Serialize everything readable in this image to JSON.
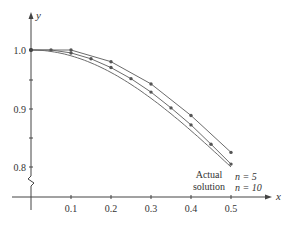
{
  "chart_data": {
    "type": "line",
    "title": "",
    "xlabel": "x",
    "ylabel": "y",
    "xlim": [
      0,
      0.55
    ],
    "ylim": [
      0.75,
      1.05
    ],
    "x_ticks": [
      "0.1",
      "0.2",
      "0.3",
      "0.4",
      "0.5"
    ],
    "y_ticks": [
      "0.8",
      "0.9",
      "1.0"
    ],
    "axis_break": "y-axis break between 0.8 and x-axis",
    "grid": false,
    "series": [
      {
        "name": "n = 5",
        "x": [
          0,
          0.1,
          0.2,
          0.3,
          0.4,
          0.5
        ],
        "y": [
          1.0,
          1.0,
          0.98,
          0.942,
          0.888,
          0.825
        ],
        "markers": true
      },
      {
        "name": "n = 10",
        "x": [
          0,
          0.05,
          0.1,
          0.15,
          0.2,
          0.25,
          0.3,
          0.35,
          0.4,
          0.45,
          0.5
        ],
        "y": [
          1.0,
          1.0,
          0.995,
          0.985,
          0.97,
          0.951,
          0.928,
          0.901,
          0.872,
          0.839,
          0.805
        ],
        "markers": true
      },
      {
        "name": "Actual solution",
        "x": [
          0,
          0.05,
          0.1,
          0.15,
          0.2,
          0.25,
          0.3,
          0.35,
          0.4,
          0.45,
          0.5
        ],
        "y": [
          1.0,
          0.9975,
          0.99,
          0.978,
          0.962,
          0.941,
          0.917,
          0.891,
          0.862,
          0.832,
          0.8
        ],
        "markers": false
      }
    ],
    "annotations": [
      {
        "text": "n = 5",
        "at": [
          0.5,
          0.825
        ]
      },
      {
        "text": "n = 10",
        "at": [
          0.5,
          0.805
        ]
      },
      {
        "text": "Actual solution",
        "at": [
          0.41,
          0.78
        ]
      }
    ]
  },
  "labels": {
    "y_axis": "y",
    "x_axis": "x",
    "y_ticks": [
      "1.0",
      "0.9",
      "0.8"
    ],
    "x_ticks": [
      "0.1",
      "0.2",
      "0.3",
      "0.4",
      "0.5"
    ],
    "n5": "n = 5",
    "n10": "n = 10",
    "actual_line1": "Actual",
    "actual_line2": "solution"
  },
  "colors": {
    "line": "#6b6b6b",
    "axis": "#444444",
    "text": "#333333"
  }
}
